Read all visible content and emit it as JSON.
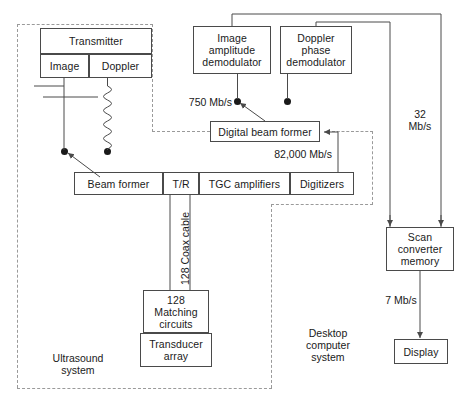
{
  "diagram": {
    "regions": [
      {
        "id": "ultrasound",
        "label": "Ultrasound\nsystem"
      },
      {
        "id": "desktop",
        "label": "Desktop\ncomputer\nsystem"
      }
    ],
    "blocks": {
      "transmitter": "Transmitter",
      "transmitter_image": "Image",
      "transmitter_doppler": "Doppler",
      "image_amplitude_demodulator": "Image\namplitude\ndemodulator",
      "doppler_phase_demodulator": "Doppler\nphase\ndemodulator",
      "digital_beam_former": "Digital beam former",
      "beam_former": "Beam former",
      "tr": "T/R",
      "tgc_amplifiers": "TGC amplifiers",
      "digitizers": "Digitizers",
      "matching_circuits": "128\nMatching\ncircuits",
      "transducer_array": "Transducer\narray",
      "scan_converter_memory": "Scan\nconverter\nmemory",
      "display": "Display"
    },
    "rate_labels": {
      "demodulator_out": "750 Mb/s",
      "digitizer_out": "82,000 Mb/s",
      "scan_converter_in": "32\nMb/s",
      "display_in": "7 Mb/s"
    },
    "cable_label": "128 Coax cable",
    "colors": {
      "line": "#4a4a4a",
      "dashed": "#9a9a9a",
      "text": "#1a1a1a",
      "background": "#ffffff"
    }
  }
}
